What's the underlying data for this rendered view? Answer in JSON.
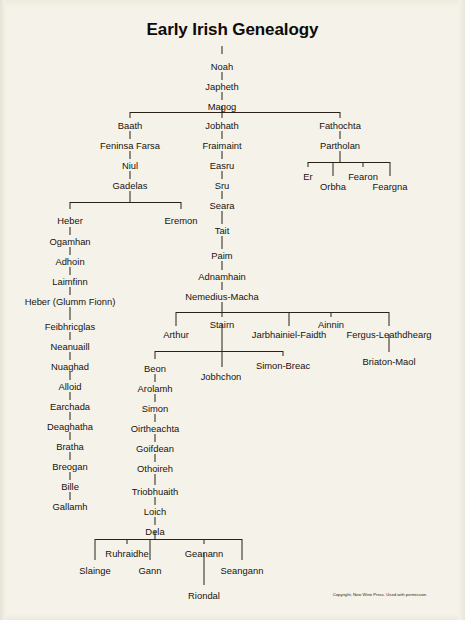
{
  "document": {
    "title": "Early Irish Genealogy",
    "copyright": "Copyright, New Wine Press. Used with permission.",
    "background_color": "#f5f2e9",
    "text_color": "#17120e",
    "line_color": "#2a2218"
  },
  "chart_data": {
    "type": "diagram",
    "subtype": "genealogy-tree",
    "title": "Early Irish Genealogy",
    "root": "Noah",
    "nodes": [
      {
        "id": "noah",
        "label": "Noah",
        "x": 222,
        "y": 62
      },
      {
        "id": "japheth",
        "label": "Japheth",
        "x": 222,
        "y": 82
      },
      {
        "id": "magog",
        "label": "Magog",
        "x": 222,
        "y": 102
      },
      {
        "id": "baath",
        "label": "Baath",
        "x": 130,
        "y": 121
      },
      {
        "id": "feninsa-farsa",
        "label": "Feninsa Farsa",
        "x": 130,
        "y": 141
      },
      {
        "id": "niul",
        "label": "Niul",
        "x": 130,
        "y": 161
      },
      {
        "id": "gadelas",
        "label": "Gadelas",
        "x": 130,
        "y": 181
      },
      {
        "id": "heber",
        "label": "Heber",
        "x": 70,
        "y": 216
      },
      {
        "id": "eremon",
        "label": "Eremon",
        "x": 181,
        "y": 216
      },
      {
        "id": "ogamhan",
        "label": "Ogamhan",
        "x": 70,
        "y": 237
      },
      {
        "id": "adhoin",
        "label": "Adhoin",
        "x": 70,
        "y": 257
      },
      {
        "id": "laimfinn",
        "label": "Laimfinn",
        "x": 70,
        "y": 277
      },
      {
        "id": "heber-glumm-fionn",
        "label": "Heber (Glumm Fionn)",
        "x": 70,
        "y": 297
      },
      {
        "id": "feibhricglas",
        "label": "Feibhricglas",
        "x": 70,
        "y": 322
      },
      {
        "id": "neanuaill",
        "label": "Neanuaill",
        "x": 70,
        "y": 342
      },
      {
        "id": "nuaghad",
        "label": "Nuaghad",
        "x": 70,
        "y": 362
      },
      {
        "id": "alloid",
        "label": "Alloid",
        "x": 70,
        "y": 382
      },
      {
        "id": "earchada",
        "label": "Earchada",
        "x": 70,
        "y": 402
      },
      {
        "id": "deaghatha",
        "label": "Deaghatha",
        "x": 70,
        "y": 422
      },
      {
        "id": "bratha",
        "label": "Bratha",
        "x": 70,
        "y": 442
      },
      {
        "id": "breogan",
        "label": "Breogan",
        "x": 70,
        "y": 462
      },
      {
        "id": "bille",
        "label": "Bille",
        "x": 70,
        "y": 482
      },
      {
        "id": "gallamh",
        "label": "Gallamh",
        "x": 70,
        "y": 502
      },
      {
        "id": "jobhath",
        "label": "Jobhath",
        "x": 222,
        "y": 121
      },
      {
        "id": "fraimaint",
        "label": "Fraimaint",
        "x": 222,
        "y": 141
      },
      {
        "id": "easru",
        "label": "Easru",
        "x": 222,
        "y": 161
      },
      {
        "id": "sru",
        "label": "Sru",
        "x": 222,
        "y": 181
      },
      {
        "id": "seara",
        "label": "Seara",
        "x": 222,
        "y": 201
      },
      {
        "id": "tait",
        "label": "Tait",
        "x": 222,
        "y": 226
      },
      {
        "id": "paim",
        "label": "Paim",
        "x": 222,
        "y": 251
      },
      {
        "id": "adnamhain",
        "label": "Adnamhain",
        "x": 222,
        "y": 272
      },
      {
        "id": "nemedius-macha",
        "label": "Nemedius-Macha",
        "x": 222,
        "y": 292
      },
      {
        "id": "arthur",
        "label": "Arthur",
        "x": 176,
        "y": 330
      },
      {
        "id": "stairn",
        "label": "Stairn",
        "x": 222,
        "y": 320
      },
      {
        "id": "jarbhainiel-faidth",
        "label": "Jarbhainiel-Faidth",
        "x": 289,
        "y": 330
      },
      {
        "id": "ainnin",
        "label": "Ainnin",
        "x": 331,
        "y": 320
      },
      {
        "id": "fergus-leathdhearg",
        "label": "Fergus-Leathdhearg",
        "x": 389,
        "y": 330
      },
      {
        "id": "briaton-maol",
        "label": "Briaton-Maol",
        "x": 389,
        "y": 357
      },
      {
        "id": "beon",
        "label": "Beon",
        "x": 155,
        "y": 364
      },
      {
        "id": "jobhchon",
        "label": "Jobhchon",
        "x": 221,
        "y": 372
      },
      {
        "id": "simon-breac",
        "label": "Simon-Breac",
        "x": 283,
        "y": 361
      },
      {
        "id": "arolamh",
        "label": "Arolamh",
        "x": 155,
        "y": 384
      },
      {
        "id": "simon",
        "label": "Simon",
        "x": 155,
        "y": 404
      },
      {
        "id": "oirtheachta",
        "label": "Oirtheachta",
        "x": 155,
        "y": 424
      },
      {
        "id": "goifdean",
        "label": "Goifdean",
        "x": 155,
        "y": 444
      },
      {
        "id": "othoireh",
        "label": "Othoireh",
        "x": 155,
        "y": 464
      },
      {
        "id": "triobhuaith",
        "label": "Triobhuaith",
        "x": 155,
        "y": 487
      },
      {
        "id": "loich",
        "label": "Loich",
        "x": 155,
        "y": 507
      },
      {
        "id": "dela",
        "label": "Dela",
        "x": 155,
        "y": 527
      },
      {
        "id": "slainge",
        "label": "Slainge",
        "x": 95,
        "y": 566
      },
      {
        "id": "ruhraidhe",
        "label": "Ruhraidhe",
        "x": 127,
        "y": 549
      },
      {
        "id": "gann",
        "label": "Gann",
        "x": 150,
        "y": 566
      },
      {
        "id": "geanann",
        "label": "Geanann",
        "x": 204,
        "y": 549
      },
      {
        "id": "seangann",
        "label": "Seangann",
        "x": 242,
        "y": 566
      },
      {
        "id": "riondal",
        "label": "Riondal",
        "x": 204,
        "y": 591
      },
      {
        "id": "fathochta",
        "label": "Fathochta",
        "x": 340,
        "y": 121
      },
      {
        "id": "partholan",
        "label": "Partholan",
        "x": 340,
        "y": 141
      },
      {
        "id": "er",
        "label": "Er",
        "x": 308,
        "y": 172
      },
      {
        "id": "orbha",
        "label": "Orbha",
        "x": 333,
        "y": 182
      },
      {
        "id": "fearon",
        "label": "Fearon",
        "x": 363,
        "y": 172
      },
      {
        "id": "feargna",
        "label": "Feargna",
        "x": 390,
        "y": 182
      }
    ],
    "edges": [
      [
        "noah",
        "japheth"
      ],
      [
        "japheth",
        "magog"
      ],
      [
        "magog",
        "baath"
      ],
      [
        "magog",
        "jobhath"
      ],
      [
        "magog",
        "fathochta"
      ],
      [
        "baath",
        "feninsa-farsa"
      ],
      [
        "feninsa-farsa",
        "niul"
      ],
      [
        "niul",
        "gadelas"
      ],
      [
        "gadelas",
        "heber"
      ],
      [
        "gadelas",
        "eremon"
      ],
      [
        "heber",
        "ogamhan"
      ],
      [
        "ogamhan",
        "adhoin"
      ],
      [
        "adhoin",
        "laimfinn"
      ],
      [
        "laimfinn",
        "heber-glumm-fionn"
      ],
      [
        "heber-glumm-fionn",
        "feibhricglas"
      ],
      [
        "feibhricglas",
        "neanuaill"
      ],
      [
        "neanuaill",
        "nuaghad"
      ],
      [
        "nuaghad",
        "alloid"
      ],
      [
        "alloid",
        "earchada"
      ],
      [
        "earchada",
        "deaghatha"
      ],
      [
        "deaghatha",
        "bratha"
      ],
      [
        "bratha",
        "breogan"
      ],
      [
        "breogan",
        "bille"
      ],
      [
        "bille",
        "gallamh"
      ],
      [
        "jobhath",
        "fraimaint"
      ],
      [
        "fraimaint",
        "easru"
      ],
      [
        "easru",
        "sru"
      ],
      [
        "sru",
        "seara"
      ],
      [
        "seara",
        "tait"
      ],
      [
        "tait",
        "paim"
      ],
      [
        "paim",
        "adnamhain"
      ],
      [
        "adnamhain",
        "nemedius-macha"
      ],
      [
        "nemedius-macha",
        "arthur"
      ],
      [
        "nemedius-macha",
        "stairn"
      ],
      [
        "nemedius-macha",
        "jarbhainiel-faidth"
      ],
      [
        "nemedius-macha",
        "ainnin"
      ],
      [
        "nemedius-macha",
        "fergus-leathdhearg"
      ],
      [
        "fergus-leathdhearg",
        "briaton-maol"
      ],
      [
        "stairn",
        "beon"
      ],
      [
        "stairn",
        "jobhchon"
      ],
      [
        "stairn",
        "simon-breac"
      ],
      [
        "beon",
        "arolamh"
      ],
      [
        "arolamh",
        "simon"
      ],
      [
        "simon",
        "oirtheachta"
      ],
      [
        "oirtheachta",
        "goifdean"
      ],
      [
        "goifdean",
        "othoireh"
      ],
      [
        "othoireh",
        "triobhuaith"
      ],
      [
        "triobhuaith",
        "loich"
      ],
      [
        "loich",
        "dela"
      ],
      [
        "dela",
        "slainge"
      ],
      [
        "dela",
        "ruhraidhe"
      ],
      [
        "dela",
        "gann"
      ],
      [
        "dela",
        "geanann"
      ],
      [
        "dela",
        "seangann"
      ],
      [
        "geanann",
        "riondal"
      ],
      [
        "fathochta",
        "partholan"
      ],
      [
        "partholan",
        "er"
      ],
      [
        "partholan",
        "orbha"
      ],
      [
        "partholan",
        "fearon"
      ],
      [
        "partholan",
        "feargna"
      ]
    ]
  },
  "lines": {
    "vertical": [
      {
        "name": "title-to-noah",
        "x": 222,
        "y": 46,
        "h": 8
      },
      {
        "name": "noah-japheth",
        "x": 222,
        "y": 72,
        "h": 8
      },
      {
        "name": "japheth-magog",
        "x": 222,
        "y": 92,
        "h": 8
      },
      {
        "name": "magog-drop",
        "x": 222,
        "y": 106,
        "h": 6
      },
      {
        "name": "branch-baath",
        "x": 130,
        "y": 112,
        "h": 6
      },
      {
        "name": "branch-jobhath",
        "x": 222,
        "y": 112,
        "h": 6
      },
      {
        "name": "branch-fathochta",
        "x": 340,
        "y": 112,
        "h": 6
      },
      {
        "name": "baath-feninsa",
        "x": 130,
        "y": 131,
        "h": 8
      },
      {
        "name": "feninsa-niul",
        "x": 130,
        "y": 151,
        "h": 8
      },
      {
        "name": "niul-gadelas",
        "x": 130,
        "y": 171,
        "h": 8
      },
      {
        "name": "gadelas-drop",
        "x": 130,
        "y": 191,
        "h": 11
      },
      {
        "name": "branch-heber",
        "x": 70,
        "y": 202,
        "h": 7
      },
      {
        "name": "branch-eremon",
        "x": 181,
        "y": 202,
        "h": 7
      },
      {
        "name": "heber-ogamhan",
        "x": 70,
        "y": 227,
        "h": 8
      },
      {
        "name": "ogamhan-adhoin",
        "x": 70,
        "y": 247,
        "h": 8
      },
      {
        "name": "adhoin-laimfinn",
        "x": 70,
        "y": 267,
        "h": 8
      },
      {
        "name": "laimfinn-heber2",
        "x": 70,
        "y": 287,
        "h": 8
      },
      {
        "name": "heber2-feibhricglas",
        "x": 70,
        "y": 307,
        "h": 13
      },
      {
        "name": "feibhricglas-neanuaill",
        "x": 70,
        "y": 332,
        "h": 8
      },
      {
        "name": "neanuaill-nuaghad",
        "x": 70,
        "y": 352,
        "h": 8
      },
      {
        "name": "nuaghad-alloid",
        "x": 70,
        "y": 372,
        "h": 8
      },
      {
        "name": "alloid-earchada",
        "x": 70,
        "y": 392,
        "h": 8
      },
      {
        "name": "earchada-deaghatha",
        "x": 70,
        "y": 412,
        "h": 8
      },
      {
        "name": "deaghatha-bratha",
        "x": 70,
        "y": 432,
        "h": 8
      },
      {
        "name": "bratha-breogan",
        "x": 70,
        "y": 452,
        "h": 8
      },
      {
        "name": "breogan-bille",
        "x": 70,
        "y": 472,
        "h": 8
      },
      {
        "name": "bille-gallamh",
        "x": 70,
        "y": 492,
        "h": 8
      },
      {
        "name": "jobhath-fraimaint",
        "x": 222,
        "y": 131,
        "h": 8
      },
      {
        "name": "fraimaint-easru",
        "x": 222,
        "y": 151,
        "h": 8
      },
      {
        "name": "easru-sru",
        "x": 222,
        "y": 171,
        "h": 8
      },
      {
        "name": "sru-seara",
        "x": 222,
        "y": 191,
        "h": 8
      },
      {
        "name": "seara-tait",
        "x": 222,
        "y": 211,
        "h": 13
      },
      {
        "name": "tait-paim",
        "x": 222,
        "y": 236,
        "h": 13
      },
      {
        "name": "paim-adnamhain",
        "x": 222,
        "y": 261,
        "h": 9
      },
      {
        "name": "adnamhain-nemedius",
        "x": 222,
        "y": 282,
        "h": 8
      },
      {
        "name": "nemedius-drop",
        "x": 222,
        "y": 302,
        "h": 10
      },
      {
        "name": "branch-arthur",
        "x": 176,
        "y": 312,
        "h": 14
      },
      {
        "name": "branch-stairn",
        "x": 222,
        "y": 312,
        "h": 5
      },
      {
        "name": "branch-jarbhainiel",
        "x": 289,
        "y": 312,
        "h": 14
      },
      {
        "name": "branch-ainnin",
        "x": 331,
        "y": 312,
        "h": 5
      },
      {
        "name": "branch-fergus",
        "x": 389,
        "y": 312,
        "h": 14
      },
      {
        "name": "fergus-briaton",
        "x": 389,
        "y": 334,
        "h": 18
      },
      {
        "name": "stairn-drop",
        "x": 222,
        "y": 324,
        "h": 27
      },
      {
        "name": "branch-beon",
        "x": 155,
        "y": 351,
        "h": 8
      },
      {
        "name": "branch-jobhchon",
        "x": 222,
        "y": 351,
        "h": 16
      },
      {
        "name": "branch-simon-breac",
        "x": 283,
        "y": 351,
        "h": 5
      },
      {
        "name": "beon-arolamh",
        "x": 155,
        "y": 374,
        "h": 8
      },
      {
        "name": "arolamh-simon",
        "x": 155,
        "y": 394,
        "h": 8
      },
      {
        "name": "simon-oirtheachta",
        "x": 155,
        "y": 414,
        "h": 8
      },
      {
        "name": "oirtheachta-goifdean",
        "x": 155,
        "y": 434,
        "h": 8
      },
      {
        "name": "goifdean-othoireh",
        "x": 155,
        "y": 454,
        "h": 8
      },
      {
        "name": "othoireh-triobhuaith",
        "x": 155,
        "y": 474,
        "h": 11
      },
      {
        "name": "triobhuaith-loich",
        "x": 155,
        "y": 497,
        "h": 8
      },
      {
        "name": "loich-dela",
        "x": 155,
        "y": 517,
        "h": 8
      },
      {
        "name": "dela-drop",
        "x": 155,
        "y": 531,
        "h": 8
      },
      {
        "name": "branch-slainge",
        "x": 95,
        "y": 539,
        "h": 21
      },
      {
        "name": "branch-ruhraidhe",
        "x": 127,
        "y": 539,
        "h": 5
      },
      {
        "name": "branch-gann",
        "x": 150,
        "y": 539,
        "h": 21
      },
      {
        "name": "branch-geanann",
        "x": 204,
        "y": 539,
        "h": 5
      },
      {
        "name": "branch-seangann",
        "x": 242,
        "y": 539,
        "h": 21
      },
      {
        "name": "geanann-riondal",
        "x": 204,
        "y": 553,
        "h": 32
      },
      {
        "name": "fathochta-partholan",
        "x": 340,
        "y": 131,
        "h": 8
      },
      {
        "name": "partholan-drop",
        "x": 340,
        "y": 151,
        "h": 11
      },
      {
        "name": "branch-er",
        "x": 308,
        "y": 162,
        "h": 5
      },
      {
        "name": "branch-orbha",
        "x": 333,
        "y": 162,
        "h": 14
      },
      {
        "name": "branch-fearon",
        "x": 363,
        "y": 162,
        "h": 5
      },
      {
        "name": "branch-feargna",
        "x": 390,
        "y": 162,
        "h": 14
      }
    ],
    "horizontal": [
      {
        "name": "magog-children-bar",
        "x": 130,
        "y": 112,
        "w": 210
      },
      {
        "name": "gadelas-children-bar",
        "x": 70,
        "y": 202,
        "w": 111
      },
      {
        "name": "nemedius-children-bar",
        "x": 176,
        "y": 312,
        "w": 213
      },
      {
        "name": "stairn-children-bar",
        "x": 155,
        "y": 351,
        "w": 128
      },
      {
        "name": "dela-children-bar",
        "x": 95,
        "y": 539,
        "w": 147
      },
      {
        "name": "partholan-children-bar",
        "x": 308,
        "y": 162,
        "w": 82
      }
    ]
  },
  "copyright_position": {
    "x": 380,
    "y": 592
  }
}
